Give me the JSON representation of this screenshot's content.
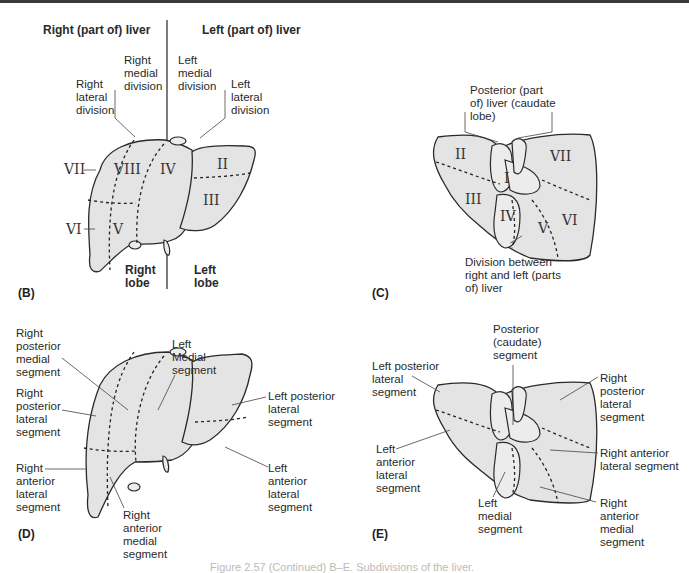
{
  "figure": {
    "caption": "Figure 2.57 (Continued) B–E. Subdivisions of the liver.",
    "panels": {
      "B": {
        "panel_label": "(B)",
        "headers": {
          "right": "Right (part of) liver",
          "left": "Left (part of) liver"
        },
        "division_labels": {
          "right_lateral": "Right\nlateral\ndivision",
          "right_medial": "Right\nmedial\ndivision",
          "left_medial": "Left\nmedial\ndivision",
          "left_lateral": "Left\nlateral\ndivision"
        },
        "segments": [
          "VII",
          "VIII",
          "IV",
          "II",
          "III",
          "VI",
          "V"
        ],
        "lobes": {
          "right": "Right\nlobe",
          "left": "Left\nlobe"
        }
      },
      "C": {
        "panel_label": "(C)",
        "caudate_label": "Posterior (part\nof) liver (caudate\nlobe)",
        "segments": [
          "II",
          "I",
          "VII",
          "III",
          "IV",
          "V",
          "VI"
        ],
        "division_label": "Division between\nright and left (parts\nof) liver"
      },
      "D": {
        "panel_label": "(D)",
        "labels": {
          "right_posterior_medial": "Right\nposterior\nmedial\nsegment",
          "right_posterior_lateral": "Right\nposterior\nlateral\nsegment",
          "left_medial": "Left\nMedial\nsegment",
          "left_posterior_lateral": "Left posterior\nlateral\nsegment",
          "right_anterior_lateral": "Right\nanterior\nlateral\nsegment",
          "right_anterior_medial": "Right\nanterior\nmedial\nsegment",
          "left_anterior_lateral": "Left\nanterior\nlateral\nsegment"
        }
      },
      "E": {
        "panel_label": "(E)",
        "labels": {
          "posterior_caudate": "Posterior\n(caudate)\nsegment",
          "left_posterior_lateral": "Left posterior\nlateral\nsegment",
          "right_posterior_lateral": "Right\nposterior\nlateral\nsegment",
          "left_anterior_lateral": "Left\nanterior\nlateral\nsegment",
          "right_anterior_lateral": "Right anterior\nlateral segment",
          "left_medial": "Left\nmedial\nsegment",
          "right_anterior_medial": "Right\nanterior\nmedial\nsegment"
        }
      }
    },
    "colors": {
      "liver_fill": "#e6e6e6",
      "outline": "#2a2a2a",
      "text": "#2a2a2a"
    }
  }
}
